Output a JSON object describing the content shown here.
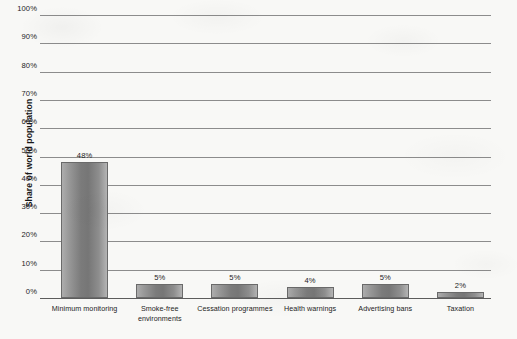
{
  "chart_data": {
    "type": "bar",
    "title": "",
    "subtitle": "",
    "xlabel": "",
    "ylabel": "Share of world population",
    "ylim": [
      0,
      100
    ],
    "yticks": [
      "0%",
      "10%",
      "20%",
      "30%",
      "40%",
      "50%",
      "60%",
      "70%",
      "80%",
      "90%",
      "100%"
    ],
    "ytick_values": [
      0,
      10,
      20,
      30,
      40,
      50,
      60,
      70,
      80,
      90,
      100
    ],
    "grid": true,
    "legend": false,
    "legend_position": "none",
    "categories": [
      "Minimum monitoring",
      "Smoke-free environments",
      "Cessation programmes",
      "Health warnings",
      "Advertising bans",
      "Taxation"
    ],
    "category_lines": [
      [
        "Minimum monitoring"
      ],
      [
        "Smoke-free",
        "environments"
      ],
      [
        "Cessation programmes"
      ],
      [
        "Health warnings"
      ],
      [
        "Advertising bans"
      ],
      [
        "Taxation"
      ]
    ],
    "values": [
      48,
      5,
      5,
      4,
      5,
      2
    ],
    "value_labels": [
      "48%",
      "5%",
      "5%",
      "4%",
      "5%",
      "2%"
    ],
    "bar_color": "#8a8a8a",
    "bar_border_color": "#6a6a6a",
    "gridline_color": "#8c8c8c",
    "axis_color": "#5c5c5c",
    "background_color": "#f8f8f6",
    "text_color": "#1d1d1d"
  }
}
